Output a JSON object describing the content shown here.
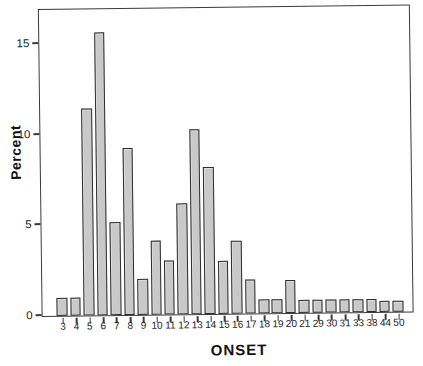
{
  "chart_data": {
    "type": "bar",
    "title": "",
    "xlabel": "ONSET",
    "ylabel": "Percent",
    "categories": [
      "3",
      "4",
      "5",
      "6",
      "7",
      "8",
      "9",
      "10",
      "11",
      "12",
      "13",
      "14",
      "15",
      "16",
      "17",
      "18",
      "19",
      "20",
      "21",
      "29",
      "30",
      "31",
      "33",
      "38",
      "44",
      "50"
    ],
    "values": [
      1.0,
      1.0,
      11.4,
      15.6,
      5.1,
      9.2,
      2.0,
      4.1,
      3.0,
      6.1,
      10.2,
      8.1,
      2.9,
      4.0,
      1.9,
      0.8,
      0.8,
      1.8,
      0.7,
      0.7,
      0.7,
      0.7,
      0.7,
      0.7,
      0.6,
      0.6
    ],
    "yticks": [
      0,
      5,
      10,
      15
    ],
    "ylim": [
      0,
      16.8
    ],
    "grid": false,
    "legend": "none",
    "bar_color": "#c9c9c9",
    "bar_border_color": "#2e2e2e",
    "axis_color": "#3a3a3a",
    "text_color": "#1c1c1c"
  }
}
